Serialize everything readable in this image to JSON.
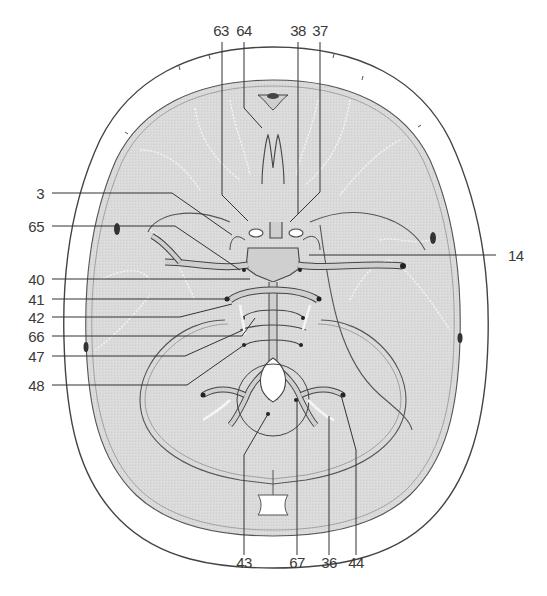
{
  "figure": {
    "type": "anatomical-diagram",
    "colors": {
      "background": "#ffffff",
      "brain_fill": "#d9d9d9",
      "line": "#444444",
      "vessel_fill": "#cfcfcf",
      "sulci": "#f5f5f5"
    }
  },
  "labels": {
    "top": [
      {
        "id": "63",
        "text": "63"
      },
      {
        "id": "64",
        "text": "64"
      },
      {
        "id": "38",
        "text": "38"
      },
      {
        "id": "37",
        "text": "37"
      }
    ],
    "left": [
      {
        "id": "3",
        "text": "3"
      },
      {
        "id": "65",
        "text": "65"
      },
      {
        "id": "40",
        "text": "40"
      },
      {
        "id": "41",
        "text": "41"
      },
      {
        "id": "42",
        "text": "42"
      },
      {
        "id": "66",
        "text": "66"
      },
      {
        "id": "47",
        "text": "47"
      },
      {
        "id": "48",
        "text": "48"
      }
    ],
    "right": [
      {
        "id": "14",
        "text": "14"
      }
    ],
    "bottom": [
      {
        "id": "43",
        "text": "43"
      },
      {
        "id": "67",
        "text": "67"
      },
      {
        "id": "36",
        "text": "36"
      },
      {
        "id": "44",
        "text": "44"
      }
    ]
  }
}
